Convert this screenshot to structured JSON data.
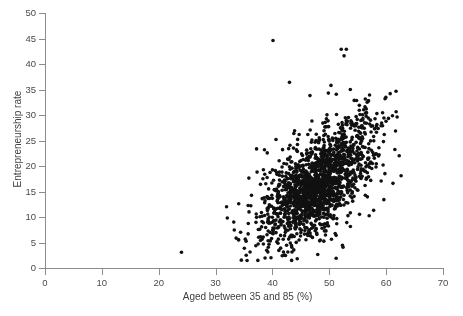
{
  "chart_data": {
    "type": "scatter",
    "title": "",
    "xlabel": "Aged between 35 and 85 (%)",
    "ylabel": "Entrepreneurship rate",
    "xlim": [
      0,
      70
    ],
    "ylim": [
      0,
      50
    ],
    "xticks": [
      0,
      10,
      20,
      30,
      40,
      50,
      60,
      70
    ],
    "yticks": [
      0,
      5,
      10,
      15,
      20,
      25,
      30,
      35,
      40,
      45,
      50
    ],
    "grid": false,
    "legend": null,
    "marker": {
      "shape": "circle",
      "color": "#111111",
      "size_px": 3.6
    },
    "n_points": 1500,
    "cluster": {
      "x_center": 48.0,
      "y_center": 16.0,
      "x_sd": 4.6,
      "y_sd": 5.2,
      "correlation": 0.55,
      "x_range": [
        33,
        62
      ],
      "y_range": [
        1,
        38
      ]
    },
    "outliers": [
      {
        "x": 40.1,
        "y": 44.6
      },
      {
        "x": 52.1,
        "y": 42.9
      },
      {
        "x": 53.0,
        "y": 42.9
      },
      {
        "x": 52.6,
        "y": 41.6
      },
      {
        "x": 24.0,
        "y": 3.1
      },
      {
        "x": 43.0,
        "y": 36.4
      },
      {
        "x": 46.6,
        "y": 33.8
      },
      {
        "x": 50.3,
        "y": 35.8
      },
      {
        "x": 53.7,
        "y": 35.0
      },
      {
        "x": 56.5,
        "y": 31.2
      },
      {
        "x": 61.2,
        "y": 16.6
      },
      {
        "x": 59.6,
        "y": 13.4
      },
      {
        "x": 57.8,
        "y": 11.3
      },
      {
        "x": 33.2,
        "y": 9.0
      },
      {
        "x": 34.4,
        "y": 7.0
      },
      {
        "x": 34.0,
        "y": 5.6
      },
      {
        "x": 36.2,
        "y": 12.2
      },
      {
        "x": 37.3,
        "y": 18.8
      },
      {
        "x": 38.6,
        "y": 23.2
      }
    ]
  },
  "axes": {
    "x_tick_labels": [
      "0",
      "10",
      "20",
      "30",
      "40",
      "50",
      "60",
      "70"
    ],
    "y_tick_labels": [
      "0",
      "5",
      "10",
      "15",
      "20",
      "25",
      "30",
      "35",
      "40",
      "45",
      "50"
    ],
    "x_title": "Aged between 35 and 85 (%)",
    "y_title": "Entrepreneurship rate"
  },
  "colors": {
    "marker": "#111111",
    "axis": "#8c8c8c",
    "text": "#4a4a4a",
    "background": "#ffffff"
  }
}
